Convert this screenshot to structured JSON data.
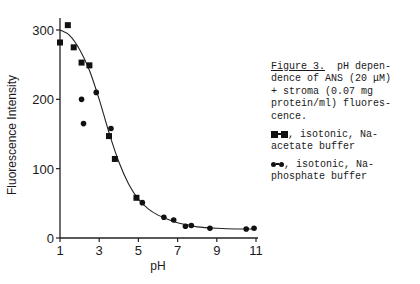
{
  "chart_data": {
    "type": "scatter",
    "title": "",
    "xlabel": "pH",
    "ylabel": "Fluorescence Intensity",
    "xlim": [
      1,
      11
    ],
    "ylim": [
      0,
      300
    ],
    "xticks": [
      1,
      3,
      5,
      7,
      9,
      11
    ],
    "yticks": [
      0,
      100,
      200,
      300
    ],
    "grid": false,
    "series": [
      {
        "name": "isotonic, Na-acetate buffer",
        "marker": "square",
        "points": [
          {
            "x": 1.0,
            "y": 282
          },
          {
            "x": 1.4,
            "y": 307
          },
          {
            "x": 1.7,
            "y": 275
          },
          {
            "x": 2.1,
            "y": 253
          },
          {
            "x": 2.5,
            "y": 249
          },
          {
            "x": 3.5,
            "y": 147
          },
          {
            "x": 3.8,
            "y": 114
          },
          {
            "x": 4.9,
            "y": 58
          }
        ]
      },
      {
        "name": "isotonic, Na-phosphate buffer",
        "marker": "circle",
        "points": [
          {
            "x": 2.1,
            "y": 200
          },
          {
            "x": 2.2,
            "y": 165
          },
          {
            "x": 2.85,
            "y": 210
          },
          {
            "x": 3.6,
            "y": 158
          },
          {
            "x": 5.2,
            "y": 51
          },
          {
            "x": 6.3,
            "y": 30
          },
          {
            "x": 6.8,
            "y": 26
          },
          {
            "x": 7.4,
            "y": 17
          },
          {
            "x": 7.7,
            "y": 18
          },
          {
            "x": 8.65,
            "y": 14
          },
          {
            "x": 10.5,
            "y": 13
          },
          {
            "x": 10.9,
            "y": 14
          }
        ]
      }
    ],
    "fit_curve": {
      "name": "fitted curve",
      "points": [
        {
          "x": 1.0,
          "y": 300
        },
        {
          "x": 1.5,
          "y": 292
        },
        {
          "x": 2.0,
          "y": 272
        },
        {
          "x": 2.5,
          "y": 242
        },
        {
          "x": 3.0,
          "y": 200
        },
        {
          "x": 3.5,
          "y": 152
        },
        {
          "x": 4.0,
          "y": 110
        },
        {
          "x": 4.5,
          "y": 78
        },
        {
          "x": 5.0,
          "y": 56
        },
        {
          "x": 5.5,
          "y": 42
        },
        {
          "x": 6.0,
          "y": 33
        },
        {
          "x": 6.5,
          "y": 27
        },
        {
          "x": 7.0,
          "y": 22
        },
        {
          "x": 7.5,
          "y": 19
        },
        {
          "x": 8.0,
          "y": 16
        },
        {
          "x": 9.0,
          "y": 14
        },
        {
          "x": 10.0,
          "y": 13
        },
        {
          "x": 11.0,
          "y": 13
        }
      ]
    }
  },
  "caption": {
    "figure_label": "Figure 3.",
    "line1_rest": "  pH depen-",
    "line2": "dence of ANS (20 μM)",
    "line3": "+ stroma (0.07 mg",
    "line4": "protein/ml) fluores-",
    "line5": "cence.",
    "legend_square_text": ", isotonic, Na-",
    "legend_square_text2": "acetate buffer",
    "legend_circle_text": ", isotonic, Na-",
    "legend_circle_text2": "phosphate buffer"
  }
}
